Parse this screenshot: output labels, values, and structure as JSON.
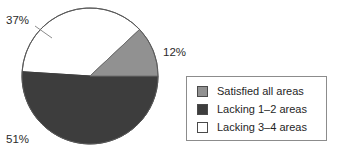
{
  "chart_data": {
    "type": "pie",
    "title": "",
    "categories": [
      "Satisfied all areas",
      "Lacking 1–2 areas",
      "Lacking 3–4 areas"
    ],
    "values": [
      12,
      51,
      37
    ],
    "value_labels": [
      "12%",
      "51%",
      "37%"
    ],
    "colors": [
      "#919191",
      "#3d3d3d",
      "#ffffff"
    ],
    "legend_position": "right",
    "grid": false,
    "slices": [
      {
        "label": "Satisfied all areas",
        "value": 12,
        "value_label": "12%",
        "color": "#919191",
        "start_angle": -43.2,
        "end_angle": 0.0
      },
      {
        "label": "Lacking 1–2 areas",
        "value": 51,
        "value_label": "51%",
        "color": "#3d3d3d",
        "start_angle": 0.0,
        "end_angle": 183.6
      },
      {
        "label": "Lacking 3–4 areas",
        "value": 37,
        "value_label": "37%",
        "color": "#ffffff",
        "start_angle": 183.6,
        "end_angle": 316.8
      }
    ],
    "geometry": {
      "center_x": 90,
      "center_y": 76,
      "radius": 68,
      "outline_color": "#5a5a5a"
    }
  },
  "labels": {
    "pct_satisfied": "12%",
    "pct_lacking_1_2": "51%",
    "pct_lacking_3_4": "37%"
  },
  "legend": {
    "items": [
      {
        "label": "Satisfied all areas",
        "color": "#919191"
      },
      {
        "label": "Lacking 1–2 areas",
        "color": "#3d3d3d"
      },
      {
        "label": "Lacking 3–4 areas",
        "color": "#ffffff"
      }
    ]
  }
}
